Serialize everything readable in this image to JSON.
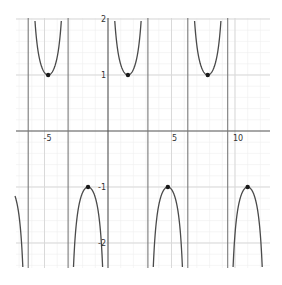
{
  "chart_data": {
    "type": "line",
    "title": "",
    "function": "y = csc(x)",
    "xlabel": "",
    "ylabel": "",
    "xlim": [
      -7.3,
      12.7
    ],
    "ylim": [
      -2.45,
      2.0
    ],
    "grid": true,
    "x_tick_labels": [
      {
        "value": -5,
        "label": "-5"
      },
      {
        "value": 5,
        "label": "5"
      },
      {
        "value": 10,
        "label": "10"
      }
    ],
    "y_tick_labels": [
      {
        "value": 2,
        "label": "2"
      },
      {
        "value": 1,
        "label": "1"
      },
      {
        "value": -1,
        "label": "-1"
      },
      {
        "value": -2,
        "label": "-2"
      }
    ],
    "asymptotes_x": [
      -6.283,
      -3.1416,
      3.1416,
      6.283,
      9.4248
    ],
    "marked_points": [
      {
        "x": -4.712,
        "y": 1
      },
      {
        "x": 1.5708,
        "y": 1
      },
      {
        "x": 7.854,
        "y": 1
      },
      {
        "x": -1.5708,
        "y": -1
      },
      {
        "x": 4.712,
        "y": -1
      },
      {
        "x": 10.996,
        "y": -1
      }
    ],
    "colors": {
      "curve": "#4a4a4a",
      "asymptote": "#7a7a7a",
      "axis": "#555555",
      "major_grid": "#d9d9d9",
      "minor_grid": "#eeeeee",
      "point": "#1a1a1a"
    }
  }
}
